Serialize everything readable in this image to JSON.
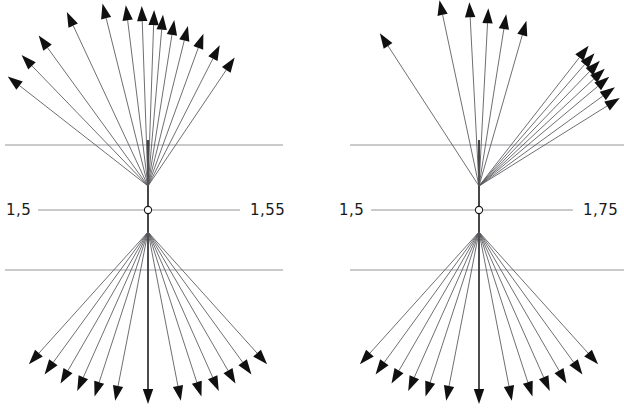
{
  "figure": {
    "width": 624,
    "height": 415,
    "background": "#ffffff",
    "line_color": "#55555a",
    "arrow_color": "#101010",
    "axis_color": "#8a8a90",
    "label_color": "#1a1a1a"
  },
  "panels": [
    {
      "id": "left-panel",
      "name": "left-vector-diagram",
      "center": {
        "x": 148,
        "y": 210
      },
      "left_label": "1,5",
      "right_label": "1,55",
      "left_label_pos": {
        "x": 6,
        "y": 215
      },
      "right_label_pos": {
        "x": 250,
        "y": 215
      },
      "axis": {
        "x1": 38,
        "x2": 240,
        "y": 210
      },
      "vertical_axis": {
        "x": 148,
        "y1": 140,
        "y2": 400
      },
      "gridlines": [
        {
          "name": "upper-reference-line",
          "x1": 5,
          "x2": 283,
          "y": 145
        },
        {
          "name": "lower-reference-line",
          "x1": 5,
          "x2": 283,
          "y": 270
        }
      ],
      "upper_fan": {
        "origin": {
          "x": 148,
          "y": 186
        },
        "count": 14,
        "angles_deg": [
          -52,
          -44,
          -36,
          -25,
          -14,
          -7,
          -2,
          2,
          5,
          9,
          14,
          20,
          27,
          34
        ],
        "lengths": [
          178,
          182,
          186,
          192,
          188,
          182,
          180,
          176,
          172,
          168,
          165,
          162,
          158,
          155
        ]
      },
      "lower_fan": {
        "origin": {
          "x": 148,
          "y": 232
        },
        "count": 13,
        "angles_deg": [
          -42,
          -36,
          -30,
          -24,
          -18,
          -11,
          0,
          11,
          18,
          24,
          30,
          36,
          42
        ],
        "lengths": [
          178,
          176,
          175,
          174,
          173,
          172,
          172,
          172,
          173,
          174,
          175,
          176,
          178
        ]
      }
    },
    {
      "id": "right-panel",
      "name": "right-vector-diagram",
      "center": {
        "x": 479,
        "y": 210
      },
      "left_label": "1,5",
      "right_label": "1,75",
      "left_label_pos": {
        "x": 339,
        "y": 215
      },
      "right_label_pos": {
        "x": 583,
        "y": 215
      },
      "axis": {
        "x1": 371,
        "x2": 573,
        "y": 210
      },
      "vertical_axis": {
        "x": 479,
        "y1": 140,
        "y2": 400
      },
      "gridlines": [
        {
          "name": "upper-reference-line",
          "x1": 350,
          "x2": 624,
          "y": 145
        },
        {
          "name": "lower-reference-line",
          "x1": 350,
          "x2": 624,
          "y": 270
        }
      ],
      "upper_fan": {
        "origin": {
          "x": 479,
          "y": 186
        },
        "count": 13,
        "angles_deg": [
          -33,
          -12,
          -3,
          3,
          9,
          16,
          38,
          41,
          44,
          47,
          50,
          54,
          58
        ],
        "lengths": [
          182,
          190,
          184,
          178,
          174,
          172,
          178,
          176,
          174,
          172,
          170,
          168,
          166
        ]
      },
      "lower_fan": {
        "origin": {
          "x": 479,
          "y": 232
        },
        "count": 13,
        "angles_deg": [
          -42,
          -36,
          -30,
          -24,
          -18,
          -11,
          0,
          11,
          18,
          24,
          30,
          36,
          42
        ],
        "lengths": [
          178,
          176,
          175,
          174,
          173,
          172,
          172,
          172,
          173,
          174,
          175,
          176,
          178
        ]
      }
    }
  ],
  "chart_data": {
    "type": "scatter",
    "title": "",
    "xlabel": "",
    "ylabel": "",
    "series": [
      {
        "name": "left-upper-fan",
        "angles_deg": [
          -52,
          -44,
          -36,
          -25,
          -14,
          -7,
          -2,
          2,
          5,
          9,
          14,
          20,
          27,
          34
        ],
        "magnitudes": [
          178,
          182,
          186,
          192,
          188,
          182,
          180,
          176,
          172,
          168,
          165,
          162,
          158,
          155
        ]
      },
      {
        "name": "left-lower-fan",
        "angles_deg": [
          -42,
          -36,
          -30,
          -24,
          -18,
          -11,
          0,
          11,
          18,
          24,
          30,
          36,
          42
        ],
        "magnitudes": [
          178,
          176,
          175,
          174,
          173,
          172,
          172,
          172,
          173,
          174,
          175,
          176,
          178
        ]
      },
      {
        "name": "right-upper-fan",
        "angles_deg": [
          -33,
          -12,
          -3,
          3,
          9,
          16,
          38,
          41,
          44,
          47,
          50,
          54,
          58
        ],
        "magnitudes": [
          182,
          190,
          184,
          178,
          174,
          172,
          178,
          176,
          174,
          172,
          170,
          168,
          166
        ]
      },
      {
        "name": "right-lower-fan",
        "angles_deg": [
          -42,
          -36,
          -30,
          -24,
          -18,
          -11,
          0,
          11,
          18,
          24,
          30,
          36,
          42
        ],
        "magnitudes": [
          178,
          176,
          175,
          174,
          173,
          172,
          172,
          172,
          173,
          174,
          175,
          176,
          178
        ]
      }
    ],
    "axis_labels": [
      "1,5",
      "1,55",
      "1,5",
      "1,75"
    ],
    "grid": true,
    "legend": "none"
  }
}
